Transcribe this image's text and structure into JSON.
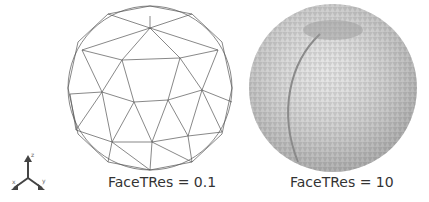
{
  "figure": {
    "panels": [
      {
        "caption": "FaceTRes = 0.1",
        "style": "wireframe-coarse"
      },
      {
        "caption": "FaceTRes = 10",
        "style": "wireframe-dense"
      }
    ],
    "triad": {
      "axes": [
        "z",
        "x",
        "y"
      ]
    }
  }
}
